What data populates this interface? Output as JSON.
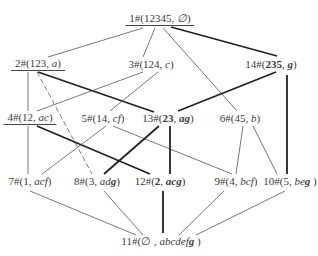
{
  "diagram": {
    "type": "concept-lattice",
    "nodes": [
      {
        "id": "n1",
        "label_id": "1#",
        "extent": "12345",
        "sep": ", ",
        "intent": "∅",
        "intent_bold": "",
        "extent_bold": false,
        "x": 160,
        "y": 19,
        "underline": true
      },
      {
        "id": "n2",
        "label_id": "2#",
        "extent": "123",
        "sep": ", ",
        "intent": "a",
        "intent_bold": "",
        "extent_bold": false,
        "x": 38,
        "y": 64,
        "underline": true
      },
      {
        "id": "n3",
        "label_id": "3#",
        "extent": "124",
        "sep": ", ",
        "intent": "c",
        "intent_bold": "",
        "extent_bold": false,
        "x": 151,
        "y": 64,
        "underline": false
      },
      {
        "id": "n14",
        "label_id": "14#",
        "extent": "235",
        "sep": ", ",
        "intent": "",
        "intent_bold": "g",
        "extent_bold": true,
        "x": 271,
        "y": 64,
        "underline": false
      },
      {
        "id": "n4",
        "label_id": "4#",
        "extent": "12",
        "sep": ", ",
        "intent": "ac",
        "intent_bold": "",
        "extent_bold": false,
        "x": 30,
        "y": 118,
        "underline": true
      },
      {
        "id": "n5",
        "label_id": "5#",
        "extent": "14",
        "sep": ", ",
        "intent": "cf",
        "intent_bold": "",
        "extent_bold": false,
        "x": 103,
        "y": 118,
        "underline": false
      },
      {
        "id": "n13",
        "label_id": "13#",
        "extent": "23",
        "sep": ", ",
        "intent": "",
        "intent_bold": "ag",
        "extent_bold": true,
        "x": 168,
        "y": 118,
        "underline": false
      },
      {
        "id": "n6",
        "label_id": "6#",
        "extent": "45",
        "sep": ", ",
        "intent": "b",
        "intent_bold": "",
        "extent_bold": false,
        "x": 240,
        "y": 118,
        "underline": false
      },
      {
        "id": "n7",
        "label_id": "7#",
        "extent": "1",
        "sep": ", ",
        "intent": "acf",
        "intent_bold": "",
        "extent_bold": false,
        "x": 30,
        "y": 181,
        "underline": false
      },
      {
        "id": "n8",
        "label_id": "8#",
        "extent": "3",
        "sep": ", ",
        "intent": "ad",
        "intent_bold": "g",
        "extent_bold": false,
        "x": 97,
        "y": 181,
        "underline": false
      },
      {
        "id": "n12",
        "label_id": "12#",
        "extent": "2",
        "sep": ", ",
        "intent": "",
        "intent_bold": "acg",
        "extent_bold": true,
        "x": 160,
        "y": 181,
        "underline": false
      },
      {
        "id": "n9",
        "label_id": "9#",
        "extent": "4",
        "sep": ", ",
        "intent": "bcf",
        "intent_bold": "",
        "extent_bold": false,
        "x": 236,
        "y": 181,
        "underline": false
      },
      {
        "id": "n10",
        "label_id": "10#",
        "extent": "5",
        "sep": ", ",
        "intent": "be",
        "intent_bold": "g",
        "extent_bold": false,
        "x": 290,
        "y": 181,
        "underline": false
      },
      {
        "id": "n11",
        "label_id": "11#",
        "extent": "∅",
        "sep": " , ",
        "intent": "abcdef",
        "intent_bold": "g",
        "extent_bold": false,
        "x": 161,
        "y": 241,
        "underline": false
      }
    ],
    "edges": [
      {
        "from": "n1",
        "to": "n2",
        "style": "thin",
        "x1": 143,
        "y1": 28,
        "x2": 48,
        "y2": 57
      },
      {
        "from": "n1",
        "to": "n3",
        "style": "thin",
        "x1": 155,
        "y1": 28,
        "x2": 143,
        "y2": 57
      },
      {
        "from": "n1",
        "to": "n6",
        "style": "thin",
        "x1": 163,
        "y1": 28,
        "x2": 237,
        "y2": 111
      },
      {
        "from": "n1",
        "to": "n14",
        "style": "thick",
        "x1": 171,
        "y1": 27,
        "x2": 277,
        "y2": 56
      },
      {
        "from": "n2",
        "to": "n4",
        "style": "thin",
        "x1": 28,
        "y1": 72,
        "x2": 28,
        "y2": 111
      },
      {
        "from": "n2",
        "to": "n8",
        "style": "dashed",
        "x1": 37,
        "y1": 72,
        "x2": 92,
        "y2": 174
      },
      {
        "from": "n2",
        "to": "n13",
        "style": "thick",
        "x1": 38,
        "y1": 72,
        "x2": 154,
        "y2": 112
      },
      {
        "from": "n3",
        "to": "n4",
        "style": "thin",
        "x1": 143,
        "y1": 72,
        "x2": 37,
        "y2": 111
      },
      {
        "from": "n3",
        "to": "n5",
        "style": "thin",
        "x1": 158,
        "y1": 72,
        "x2": 110,
        "y2": 111
      },
      {
        "from": "n14",
        "to": "n13",
        "style": "thick",
        "x1": 276,
        "y1": 72,
        "x2": 178,
        "y2": 111
      },
      {
        "from": "n14",
        "to": "n10",
        "style": "thick",
        "x1": 287,
        "y1": 75,
        "x2": 287,
        "y2": 174
      },
      {
        "from": "n4",
        "to": "n7",
        "style": "thin",
        "x1": 28,
        "y1": 126,
        "x2": 28,
        "y2": 174
      },
      {
        "from": "n4",
        "to": "n12",
        "style": "thick",
        "x1": 37,
        "y1": 126,
        "x2": 150,
        "y2": 174
      },
      {
        "from": "n5",
        "to": "n7",
        "style": "thin",
        "x1": 106,
        "y1": 126,
        "x2": 42,
        "y2": 174
      },
      {
        "from": "n5",
        "to": "n9",
        "style": "thin",
        "x1": 113,
        "y1": 126,
        "x2": 232,
        "y2": 174
      },
      {
        "from": "n13",
        "to": "n8",
        "style": "thick",
        "x1": 159,
        "y1": 126,
        "x2": 104,
        "y2": 174
      },
      {
        "from": "n13",
        "to": "n12",
        "style": "thick",
        "x1": 170,
        "y1": 126,
        "x2": 170,
        "y2": 174
      },
      {
        "from": "n6",
        "to": "n9",
        "style": "thin",
        "x1": 243,
        "y1": 126,
        "x2": 236,
        "y2": 174
      },
      {
        "from": "n6",
        "to": "n10",
        "style": "thin",
        "x1": 253,
        "y1": 126,
        "x2": 277,
        "y2": 174
      },
      {
        "from": "n7",
        "to": "n11",
        "style": "thin",
        "x1": 30,
        "y1": 191,
        "x2": 136,
        "y2": 235
      },
      {
        "from": "n8",
        "to": "n11",
        "style": "thin",
        "x1": 104,
        "y1": 191,
        "x2": 143,
        "y2": 235
      },
      {
        "from": "n12",
        "to": "n11",
        "style": "thick",
        "x1": 163,
        "y1": 191,
        "x2": 163,
        "y2": 233
      },
      {
        "from": "n9",
        "to": "n11",
        "style": "thin",
        "x1": 224,
        "y1": 191,
        "x2": 179,
        "y2": 235
      },
      {
        "from": "n10",
        "to": "n11",
        "style": "thin",
        "x1": 285,
        "y1": 191,
        "x2": 196,
        "y2": 235
      }
    ],
    "colors": {
      "line": "#555555",
      "thick_line": "#222222",
      "text": "#3a3a3a",
      "background": "#ffffff"
    }
  }
}
